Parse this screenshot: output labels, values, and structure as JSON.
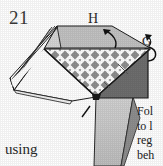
{
  "page": {
    "width": 163,
    "height": 166,
    "background": "#ffffff",
    "kind": "scanned-origami-instruction-figure"
  },
  "figure": {
    "step_number": "21",
    "labels": {
      "h": "H",
      "g": "G"
    },
    "caption_fragment": "using",
    "margin_note_lines": [
      "Fol",
      "to l",
      "reg",
      "beh"
    ],
    "colors": {
      "ink": "#1a1a1a",
      "outline": "#141414",
      "paper_white": "#ffffff",
      "light_gray": "#c9c9c9",
      "mid_gray": "#a8a8a8",
      "dark_gray": "#6e6e6e",
      "checker_diamond": "#8c8c8c",
      "shadow_gray": "#585858"
    },
    "elements": [
      {
        "name": "top-band",
        "shape": "trapezoid",
        "fill": "#c2c2c2",
        "label": "H"
      },
      {
        "name": "checkered-panel",
        "shape": "trapezoid",
        "fill": "diamond-checker"
      },
      {
        "name": "right-dark-panel",
        "shape": "triangle",
        "fill": "#6e6e6e"
      },
      {
        "name": "left-layered-folds",
        "shape": "stacked-edges",
        "fill": "#ffffff"
      },
      {
        "name": "lower-white-flap",
        "shape": "quadrilateral",
        "fill": "#ffffff"
      },
      {
        "name": "hanging-gray-flap",
        "shape": "wedge",
        "fill": "#c9c9c9"
      },
      {
        "name": "curved-arrow-g",
        "shape": "hook-arrow"
      },
      {
        "name": "curved-arrow-top",
        "shape": "hook-arrow"
      },
      {
        "name": "fold-tick-mark",
        "shape": "short-diagonal-stroke"
      }
    ]
  }
}
